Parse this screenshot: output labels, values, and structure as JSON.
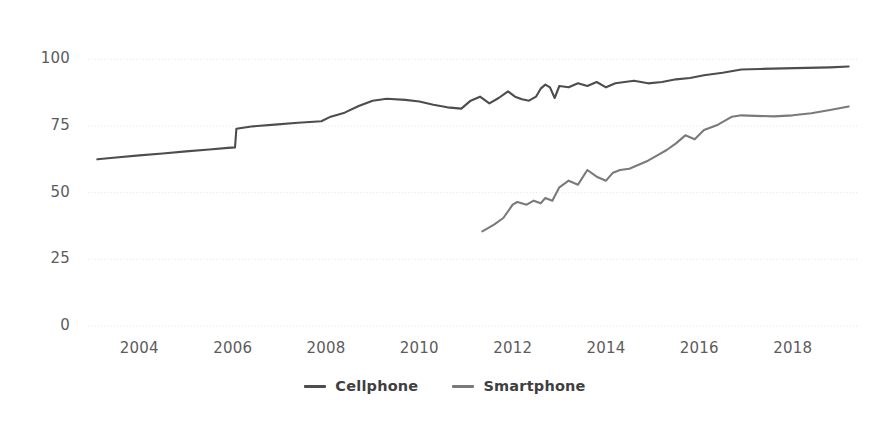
{
  "chart_data": {
    "type": "line",
    "title": "",
    "subtitle": "",
    "xlabel": "",
    "ylabel": "",
    "xlim": [
      2002.9,
      2019.4
    ],
    "ylim": [
      0,
      108
    ],
    "grid": true,
    "grid_style": "dotted-horizontal",
    "legend_position": "bottom-center",
    "y_ticks": [
      "100",
      "75",
      "50",
      "25",
      "0"
    ],
    "y_tick_values": [
      100,
      75,
      50,
      25,
      0
    ],
    "x_ticks": [
      "2004",
      "2006",
      "2008",
      "2010",
      "2012",
      "2014",
      "2016",
      "2018"
    ],
    "x_tick_values": [
      2004,
      2006,
      2008,
      2010,
      2012,
      2014,
      2016,
      2018
    ],
    "series": [
      {
        "name": "Cellphone",
        "color": "#4d4d4d",
        "x": [
          2003.1,
          2003.5,
          2004.0,
          2004.5,
          2005.0,
          2005.5,
          2005.9,
          2006.05,
          2006.08,
          2006.4,
          2006.9,
          2007.4,
          2007.9,
          2008.1,
          2008.4,
          2008.7,
          2009.0,
          2009.3,
          2009.7,
          2010.0,
          2010.3,
          2010.6,
          2010.9,
          2011.1,
          2011.3,
          2011.5,
          2011.7,
          2011.9,
          2012.05,
          2012.2,
          2012.35,
          2012.5,
          2012.6,
          2012.7,
          2012.8,
          2012.9,
          2013.0,
          2013.2,
          2013.4,
          2013.6,
          2013.8,
          2014.0,
          2014.2,
          2014.4,
          2014.6,
          2014.9,
          2015.2,
          2015.5,
          2015.8,
          2016.1,
          2016.5,
          2016.9,
          2017.3,
          2017.8,
          2018.3,
          2018.8,
          2019.2
        ],
        "y": [
          62.5,
          63.2,
          64.0,
          64.7,
          65.5,
          66.2,
          66.8,
          67.0,
          74.0,
          74.8,
          75.5,
          76.2,
          76.8,
          78.5,
          80.0,
          82.5,
          84.5,
          85.2,
          84.8,
          84.2,
          83.0,
          82.0,
          81.5,
          84.5,
          86.0,
          83.5,
          85.5,
          88.0,
          86.0,
          85.0,
          84.5,
          86.0,
          89.0,
          90.5,
          89.5,
          85.5,
          90.0,
          89.5,
          91.0,
          90.0,
          91.5,
          89.5,
          91.0,
          91.5,
          92.0,
          91.0,
          91.5,
          92.5,
          93.0,
          94.0,
          95.0,
          96.2,
          96.4,
          96.6,
          96.8,
          97.0,
          97.3
        ]
      },
      {
        "name": "Smartphone",
        "color": "#7a7a7a",
        "x": [
          2011.35,
          2011.6,
          2011.8,
          2012.0,
          2012.1,
          2012.3,
          2012.45,
          2012.6,
          2012.7,
          2012.85,
          2013.0,
          2013.2,
          2013.4,
          2013.6,
          2013.8,
          2014.0,
          2014.15,
          2014.3,
          2014.5,
          2014.7,
          2014.9,
          2015.1,
          2015.3,
          2015.5,
          2015.7,
          2015.9,
          2016.1,
          2016.4,
          2016.7,
          2016.9,
          2017.2,
          2017.6,
          2018.0,
          2018.4,
          2018.8,
          2019.2
        ],
        "y": [
          35.5,
          38.0,
          40.5,
          45.5,
          46.5,
          45.5,
          47.0,
          46.0,
          48.0,
          47.0,
          52.0,
          54.5,
          53.0,
          58.5,
          56.0,
          54.5,
          57.5,
          58.5,
          59.0,
          60.5,
          62.0,
          64.0,
          66.0,
          68.5,
          71.5,
          70.0,
          73.5,
          75.5,
          78.5,
          79.0,
          78.8,
          78.6,
          79.0,
          79.8,
          81.0,
          82.3
        ]
      }
    ],
    "annotations": []
  },
  "legend": {
    "items": [
      {
        "label": "Cellphone",
        "color": "#4d4d4d"
      },
      {
        "label": "Smartphone",
        "color": "#7a7a7a"
      }
    ]
  },
  "axes": {
    "grid_color": "#e4e4e4",
    "tick_text_color": "#5c5c5c"
  }
}
